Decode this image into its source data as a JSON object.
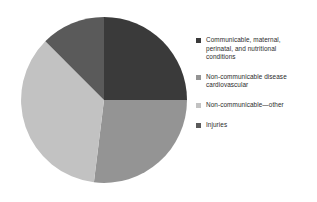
{
  "chart_data": {
    "type": "pie",
    "title": "",
    "categories": [
      "Communicable, maternal, perinatal, and nutritional conditions",
      "Non-communicable disease cardiovascular",
      "Non-communicable—other",
      "Injuries"
    ],
    "values": [
      25.0,
      27.0,
      35.5,
      12.5
    ],
    "colors": [
      "#3a3a3a",
      "#949494",
      "#c2c2c2",
      "#5a5a5a"
    ],
    "start_angle_deg": 0,
    "direction": "clockwise",
    "legend_position": "right",
    "grid": false,
    "xlabel": "",
    "ylabel": ""
  },
  "legend": {
    "items": [
      {
        "label": "Communicable, maternal,\nperinatal, and nutritional\nconditions",
        "color": "#3a3a3a"
      },
      {
        "label": "Non-communicable disease\ncardiovascular",
        "color": "#949494"
      },
      {
        "label": "Non-communicable—other",
        "color": "#c2c2c2"
      },
      {
        "label": "Injuries",
        "color": "#5a5a5a"
      }
    ]
  },
  "pie": {
    "slices": [
      {
        "name": "communicable-maternal-perinatal-nutritional",
        "percent": 25.0,
        "color": "#3a3a3a",
        "path": "M 85 85 L 85 2 A 83 83 0 0 1 168 85 Z"
      },
      {
        "name": "non-communicable-cardiovascular",
        "percent": 27.0,
        "color": "#949494",
        "path": "M 85 85 L 168 85 A 83 83 0 0 1 74.9 167.3 Z"
      },
      {
        "name": "non-communicable-other",
        "percent": 35.5,
        "color": "#c2c2c2",
        "path": "M 85 85 L 74.9 167.3 A 83 83 0 0 1 26.3 26.3 Z"
      },
      {
        "name": "injuries",
        "percent": 12.5,
        "color": "#5a5a5a",
        "path": "M 85 85 L 26.3 26.3 A 83 83 0 0 1 85 2 Z"
      }
    ]
  }
}
